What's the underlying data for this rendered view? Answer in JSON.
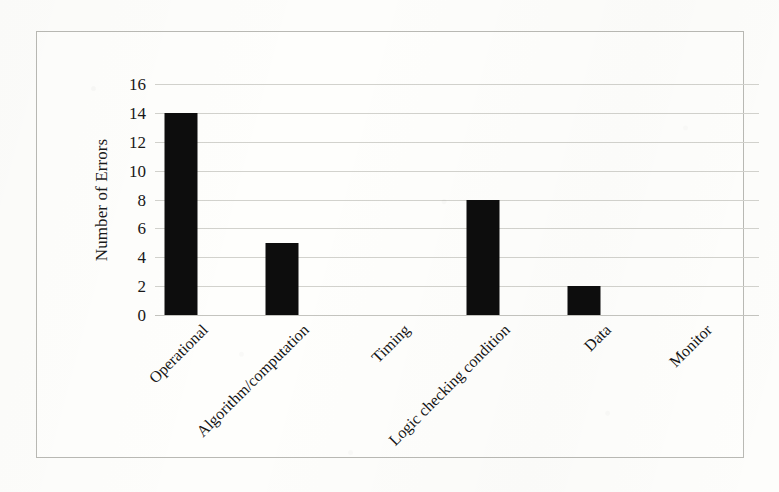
{
  "figure": {
    "background_color": "#fdfdfb",
    "border_color": "#b9b9b4",
    "bar_color": "#0d0d0d",
    "gridline_color": "#d2d2cd"
  },
  "axes": {
    "y_axis_title": "Number of Errors",
    "y_ticks": [
      "0",
      "2",
      "4",
      "6",
      "8",
      "10",
      "12",
      "14",
      "16"
    ],
    "x_labels": [
      "Operational",
      "Algorithm/computation",
      "Timing",
      "Logic checking condition",
      "Data",
      "Monitor"
    ]
  },
  "chart_data": {
    "type": "bar",
    "title": "",
    "xlabel": "",
    "ylabel": "Number of Errors",
    "categories": [
      "Operational",
      "Algorithm/computation",
      "Timing",
      "Logic checking condition",
      "Data",
      "Monitor"
    ],
    "values": [
      14,
      5,
      0,
      8,
      2,
      0
    ],
    "ylim": [
      0,
      16
    ],
    "ytick_step": 2,
    "grid": true,
    "legend": false,
    "bar_color": "#0d0d0d",
    "x_label_rotation": -45
  }
}
